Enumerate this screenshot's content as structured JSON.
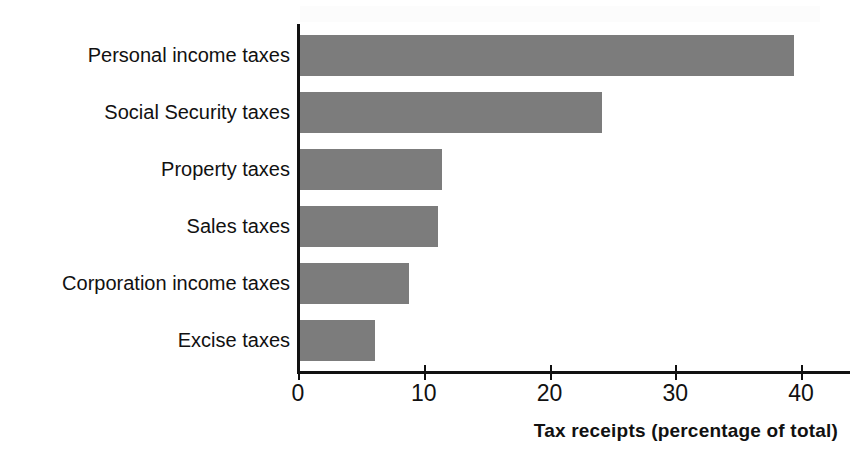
{
  "chart_data": {
    "type": "bar",
    "orientation": "horizontal",
    "title": "",
    "xlabel": "Tax receipts (percentage of total)",
    "ylabel": "",
    "categories": [
      "Personal income taxes",
      "Social Security taxes",
      "Property taxes",
      "Sales taxes",
      "Corporation income taxes",
      "Excise taxes"
    ],
    "values": [
      39.3,
      24.0,
      11.3,
      11.0,
      8.7,
      6.0
    ],
    "xlim": [
      0,
      40
    ],
    "xticks": [
      0,
      10,
      20,
      30,
      40
    ],
    "xtick_labels": [
      "0",
      "10",
      "20",
      "30",
      "40"
    ],
    "grid": false,
    "legend": false,
    "bar_color": "#7c7c7c",
    "axis_color": "#111111"
  },
  "axis": {
    "x_title": "Tax receipts (percentage of total)"
  }
}
